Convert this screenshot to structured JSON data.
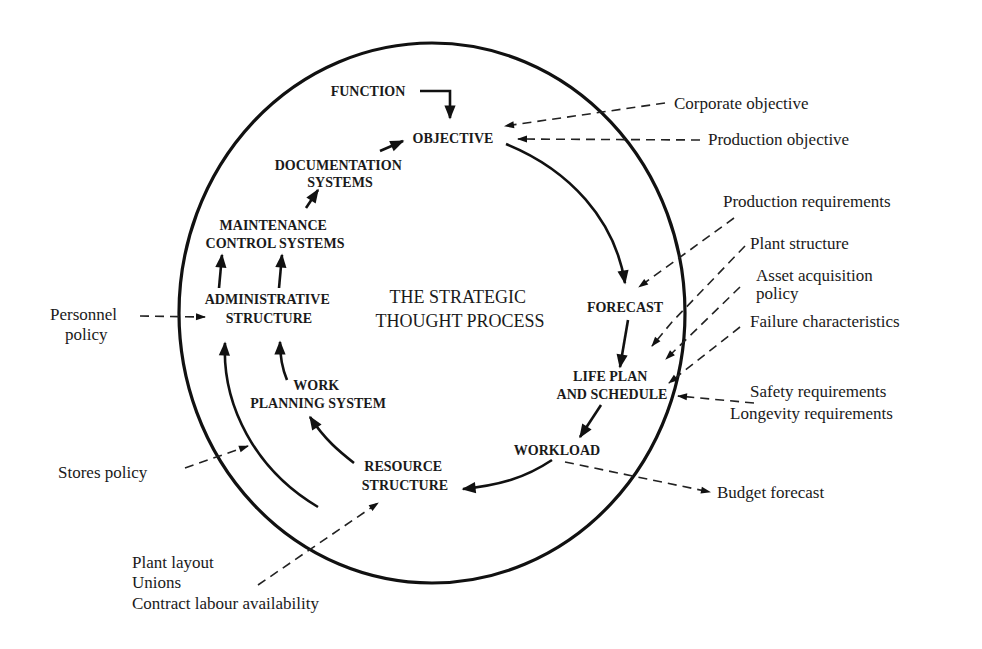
{
  "diagram": {
    "title_lines": [
      "THE STRATEGIC",
      "THOUGHT PROCESS"
    ],
    "nodes": {
      "function": [
        "FUNCTION"
      ],
      "objective": [
        "OBJECTIVE"
      ],
      "forecast": [
        "FORECAST"
      ],
      "life_plan": [
        "LIFE PLAN",
        "AND SCHEDULE"
      ],
      "workload": [
        "WORKLOAD"
      ],
      "resource": [
        "RESOURCE",
        "STRUCTURE"
      ],
      "work_planning": [
        "WORK",
        "PLANNING SYSTEM"
      ],
      "administrative": [
        "ADMINISTRATIVE",
        "STRUCTURE"
      ],
      "maintenance_control": [
        "MAINTENANCE",
        "CONTROL SYSTEMS"
      ],
      "documentation": [
        "DOCUMENTATION",
        "SYSTEMS"
      ]
    },
    "external_inputs": {
      "corporate_objective": [
        "Corporate objective"
      ],
      "production_objective": [
        "Production objective"
      ],
      "production_requirements": [
        "Production requirements"
      ],
      "plant_structure": [
        "Plant structure"
      ],
      "asset_acquisition": [
        "Asset acquisition",
        "policy"
      ],
      "failure_characteristics": [
        "Failure characteristics"
      ],
      "safety_longevity": [
        "Safety requirements",
        "Longevity requirements"
      ],
      "personnel_policy": [
        "Personnel",
        "policy"
      ],
      "stores_policy": [
        "Stores policy"
      ],
      "plant_layout_group": [
        "Plant layout",
        "Unions",
        "Contract labour availability"
      ]
    },
    "external_outputs": {
      "budget_forecast": [
        "Budget forecast"
      ]
    },
    "flow": [
      "FUNCTION -> OBJECTIVE",
      "OBJECTIVE -> FORECAST",
      "FORECAST -> LIFE PLAN AND SCHEDULE",
      "LIFE PLAN AND SCHEDULE -> WORKLOAD",
      "WORKLOAD -> RESOURCE STRUCTURE",
      "RESOURCE STRUCTURE -> WORK PLANNING SYSTEM",
      "RESOURCE STRUCTURE -> ADMINISTRATIVE STRUCTURE",
      "WORK PLANNING SYSTEM -> ADMINISTRATIVE STRUCTURE",
      "ADMINISTRATIVE STRUCTURE -> MAINTENANCE CONTROL SYSTEMS",
      "MAINTENANCE CONTROL SYSTEMS -> DOCUMENTATION SYSTEMS",
      "DOCUMENTATION SYSTEMS -> OBJECTIVE"
    ],
    "colors": {
      "ink": "#111111",
      "background": "#ffffff"
    }
  }
}
